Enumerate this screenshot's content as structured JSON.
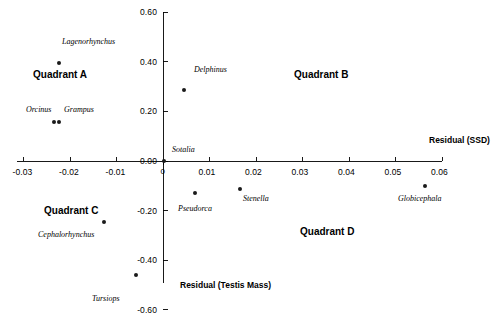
{
  "chart_data": {
    "type": "scatter",
    "title": "",
    "xlabel": "Residual (SSD)",
    "ylabel": "Residual (Testis Mass)",
    "xlim": [
      -0.032,
      0.062
    ],
    "ylim": [
      -0.6,
      0.6
    ],
    "grid": false,
    "legend": "none",
    "xticks": [
      -0.03,
      -0.02,
      -0.01,
      0,
      0.01,
      0.02,
      0.03,
      0.04,
      0.05,
      0.06
    ],
    "xtick_labels": [
      "-0.03",
      "-0.02",
      "-0.01",
      "0",
      "0.01",
      "0.02",
      "0.03",
      "0.04",
      "0.05",
      "0.06"
    ],
    "yticks": [
      -0.6,
      -0.4,
      -0.2,
      0.0,
      0.2,
      0.4,
      0.6
    ],
    "ytick_labels": [
      "-0.60",
      "-0.40",
      "-0.20",
      "0.00",
      "0.20",
      "0.40",
      "0.60"
    ],
    "points": [
      {
        "label": "Lagenorhynchus",
        "x": -0.0225,
        "y": 0.415,
        "px": 59,
        "py": 63,
        "lx": 62,
        "ly": 38
      },
      {
        "label": "Orcinus",
        "x": -0.0236,
        "y": 0.17,
        "px": 54,
        "py": 122,
        "lx": 26,
        "ly": 106
      },
      {
        "label": "Grampus",
        "x": -0.0225,
        "y": 0.17,
        "px": 59,
        "py": 122,
        "lx": 64,
        "ly": 106
      },
      {
        "label": "Delphinus",
        "x": 0.0045,
        "y": 0.3,
        "px": 184,
        "py": 90,
        "lx": 194,
        "ly": 66
      },
      {
        "label": "Sotalia",
        "x": 0.0,
        "y": 0.0,
        "px": 164,
        "py": 161,
        "lx": 172,
        "ly": 146
      },
      {
        "label": "Pseudorca",
        "x": 0.0068,
        "y": -0.133,
        "px": 195,
        "py": 193,
        "lx": 178,
        "ly": 205
      },
      {
        "label": "Stenella",
        "x": 0.0165,
        "y": -0.118,
        "px": 240,
        "py": 189,
        "lx": 243,
        "ly": 195
      },
      {
        "label": "Globicephala",
        "x": 0.0562,
        "y": -0.092,
        "px": 425,
        "py": 186,
        "lx": 398,
        "ly": 195
      },
      {
        "label": "Cephalorhynchus",
        "x": -0.0128,
        "y": -0.235,
        "px": 104,
        "py": 222,
        "lx": 38,
        "ly": 231
      },
      {
        "label": "Tursiops",
        "x": -0.0059,
        "y": -0.497,
        "px": 136,
        "py": 275,
        "lx": 92,
        "ly": 295
      }
    ],
    "annotations": [
      {
        "text": "Quadrant A",
        "px": 33,
        "py": 70
      },
      {
        "text": "Quadrant B",
        "px": 294,
        "py": 70
      },
      {
        "text": "Quadrant C",
        "px": 44,
        "py": 206
      },
      {
        "text": "Quadrant D",
        "px": 300,
        "py": 227
      }
    ],
    "origin_tick_label": "0",
    "colors": {
      "point": "#1a1a1a",
      "axis": "#000000",
      "background": "#ffffff"
    }
  },
  "axis_geometry": {
    "x_axis_y_px": 161,
    "x_axis_left_px": 17,
    "x_axis_right_px": 442,
    "y_axis_x_px": 163,
    "y_axis_top_px": 12,
    "y_axis_bottom_px": 283,
    "x_px_per_unit": 4650,
    "y_px_per_unit": 248.3
  }
}
